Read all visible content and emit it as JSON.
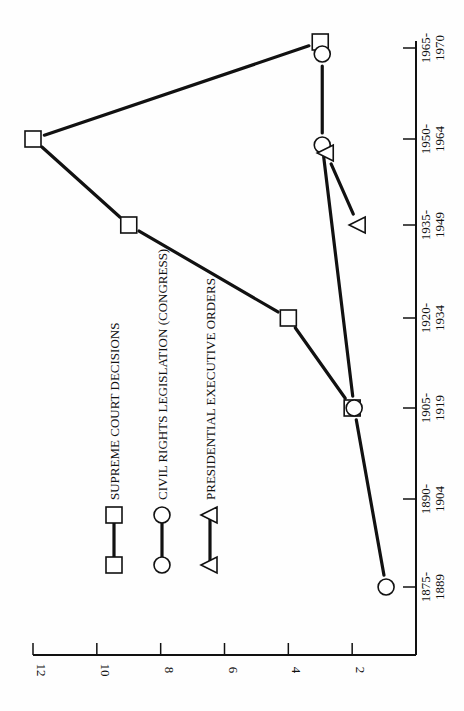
{
  "chart_data": {
    "type": "line",
    "orientation": "rotated-90-ccw",
    "title": "",
    "xlabel": "",
    "ylabel": "",
    "categories": [
      "1875-1889",
      "1890-1904",
      "1905-1919",
      "1920-1934",
      "1935-1949",
      "1950-1964",
      "1965-1970"
    ],
    "category_labels": [
      [
        "1875-",
        "1889"
      ],
      [
        "1890-",
        "1904"
      ],
      [
        "1905-",
        "1919"
      ],
      [
        "1920-",
        "1934"
      ],
      [
        "1935-",
        "1949"
      ],
      [
        "1950-",
        "1964"
      ],
      [
        "1965-",
        "1970"
      ]
    ],
    "yticks": [
      2,
      4,
      6,
      8,
      10,
      12
    ],
    "ylim": [
      0,
      12
    ],
    "grid": false,
    "legend_position": "inside-upper-left (rotated)",
    "series": [
      {
        "name": "SUPREME COURT DECISIONS",
        "marker": "square",
        "values": [
          null,
          null,
          2,
          4,
          9,
          12,
          3
        ]
      },
      {
        "name": "CIVIL RIGHTS LEGISLATION (CONGRESS)",
        "marker": "circle",
        "values": [
          1,
          null,
          2,
          null,
          null,
          3,
          3
        ]
      },
      {
        "name": "PRESIDENTIAL EXECUTIVE ORDERS",
        "marker": "triangle",
        "values": [
          null,
          null,
          null,
          null,
          2,
          3,
          null
        ]
      }
    ]
  }
}
